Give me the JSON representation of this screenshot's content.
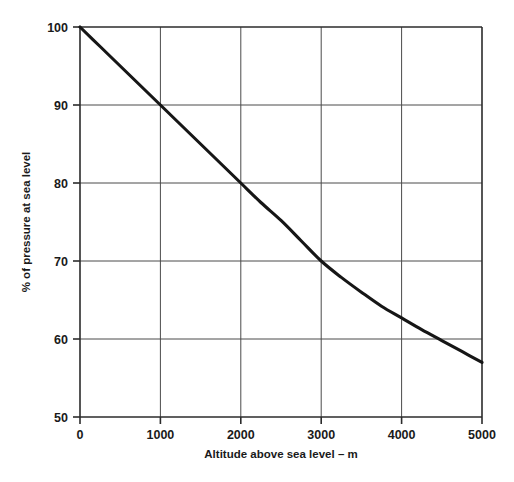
{
  "chart_data": {
    "type": "line",
    "title": "",
    "xlabel": "Altitude above sea level – m",
    "ylabel": "% of pressure at sea level",
    "xlim": [
      0,
      5000
    ],
    "ylim": [
      50,
      100
    ],
    "grid": true,
    "legend": false,
    "legend_position": "none",
    "xticks": [
      0,
      1000,
      2000,
      3000,
      4000,
      5000
    ],
    "xtick_labels": [
      "0",
      "1000",
      "2000",
      "3000",
      "4000",
      "5000"
    ],
    "yticks": [
      50,
      60,
      70,
      80,
      90,
      100
    ],
    "ytick_labels": [
      "50",
      "60",
      "70",
      "80",
      "90",
      "100"
    ],
    "line_color": "#161616",
    "grid_color": "#4a4a4a",
    "x": [
      0,
      250,
      500,
      750,
      1000,
      1250,
      1500,
      1750,
      2000,
      2250,
      2500,
      2750,
      3000,
      3250,
      3500,
      3750,
      4000,
      4250,
      4500,
      4750,
      5000
    ],
    "series": [
      {
        "name": "Atmospheric pressure",
        "values": [
          100.0,
          97.5,
          95.0,
          92.5,
          90.0,
          87.5,
          85.0,
          82.5,
          80.0,
          77.5,
          75.2,
          72.6,
          70.0,
          67.9,
          66.0,
          64.2,
          62.7,
          61.2,
          59.8,
          58.4,
          57.0
        ]
      }
    ],
    "labeled_points": [
      {
        "x": 0,
        "y": 100
      },
      {
        "x": 1000,
        "y": 90
      },
      {
        "x": 2000,
        "y": 80
      },
      {
        "x": 3000,
        "y": 70
      },
      {
        "x": 4000,
        "y": 62.7
      },
      {
        "x": 5000,
        "y": 57
      }
    ]
  }
}
